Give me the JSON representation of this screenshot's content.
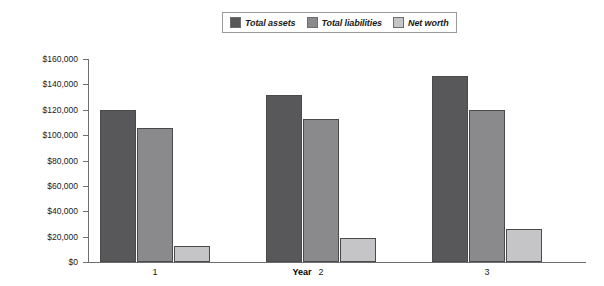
{
  "chart_data": {
    "type": "bar",
    "title": "",
    "xlabel": "Year",
    "ylabel": "",
    "categories": [
      "1",
      "2",
      "3"
    ],
    "series": [
      {
        "name": "Total assets",
        "color": "#58585a",
        "values": [
          120000,
          132000,
          147000
        ]
      },
      {
        "name": "Total liabilities",
        "color": "#8a8a8c",
        "values": [
          106000,
          113000,
          120000
        ]
      },
      {
        "name": "Net worth",
        "color": "#c5c5c7",
        "values": [
          13000,
          19000,
          26000
        ]
      }
    ],
    "ylim": [
      0,
      160000
    ],
    "ytick_values": [
      0,
      20000,
      40000,
      60000,
      80000,
      100000,
      120000,
      140000,
      160000
    ],
    "ytick_labels": [
      "$0",
      "$20,000",
      "$40,000",
      "$60,000",
      "$80,000",
      "$100,000",
      "$120,000",
      "$140,000",
      "$160,000"
    ],
    "grid": false,
    "legend_position": "top-center",
    "legend_entries": [
      "Total assets",
      "Total liabilities",
      "Net worth"
    ]
  },
  "axes": {
    "x_title": "Year",
    "x_categories": [
      "1",
      "2",
      "3"
    ],
    "y_labels": [
      "$160,000",
      "$140,000",
      "$120,000",
      "$100,000",
      "$80,000",
      "$60,000",
      "$40,000",
      "$20,000",
      "$0"
    ]
  },
  "legend": {
    "items": [
      {
        "label": "Total assets",
        "color": "#58585a"
      },
      {
        "label": "Total liabilities",
        "color": "#8a8a8c"
      },
      {
        "label": "Net worth",
        "color": "#c5c5c7"
      }
    ]
  }
}
